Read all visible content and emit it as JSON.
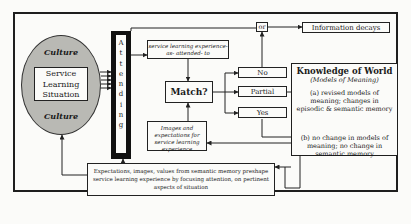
{
  "diagram": {
    "culture_top": "Culture",
    "culture_bottom": "Culture",
    "situation_box": "Service Learning Situation",
    "attending_letters": [
      "A",
      "t",
      "t",
      "e",
      "n",
      "d",
      "i",
      "n",
      "g"
    ],
    "service_experience": "service learning experience-as- attended- to",
    "match": "Match?",
    "options": {
      "no": "No",
      "partial": "Partial",
      "yes": "Yes"
    },
    "or_label": "or",
    "information_decays": "Information decays",
    "images_expectations": "Images and expectations for service learning experience",
    "knowledge": {
      "title": "Knowledge of World",
      "subtitle": "(Models of Meaning)",
      "outcome_a": "(a) revised models of meaning; changes in episodic & semantic memory",
      "outcome_b": "(b) no change in models of meaning; no change in semantic memory"
    },
    "expectations_box": "Expectations, images, values from semantic memory preshape service learning experience by focusing attention, on pertinent aspects of situation"
  }
}
